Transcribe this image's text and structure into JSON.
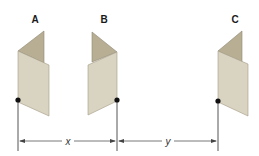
{
  "figure": {
    "objects": [
      {
        "label": "A",
        "orientation": "flap-right"
      },
      {
        "label": "B",
        "orientation": "flap-left"
      },
      {
        "label": "C",
        "orientation": "flap-right"
      }
    ],
    "dimensions": [
      {
        "label": "x",
        "from": "A",
        "to": "B"
      },
      {
        "label": "y",
        "from": "B",
        "to": "C"
      }
    ],
    "colors": {
      "flap": "#b7ae94",
      "panel": "#d9d3c2",
      "line": "#555555",
      "dot": "#111111"
    }
  }
}
